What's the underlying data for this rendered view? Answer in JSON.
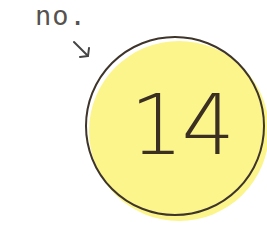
{
  "label": "no.",
  "number": "14",
  "icons": {
    "arrow": "arrow-down-right-icon"
  },
  "colors": {
    "fill": "#fbf58c",
    "outline": "#3e342a",
    "text": "#3b2f22",
    "label": "#555250"
  }
}
